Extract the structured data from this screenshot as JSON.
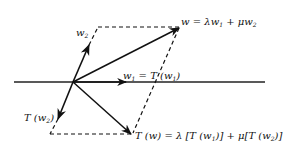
{
  "diagram": {
    "type": "vector-parallelogram",
    "colors": {
      "stroke": "#111111",
      "background": "#ffffff"
    },
    "labels": {
      "w2": {
        "main": "w",
        "sub": "2"
      },
      "w": {
        "text": "w = λw",
        "sub1": "1",
        "mid": " + μw",
        "sub2": "2"
      },
      "w1": {
        "text": "w",
        "sub1": "1",
        "mid": " = T (w",
        "sub2": "1",
        "end": ")"
      },
      "Tw2": {
        "text": "T (w",
        "sub": "2",
        "end": ")"
      },
      "Tw": {
        "text": "T (w) = λ [T (w",
        "sub1": "1",
        "mid": ")] + μ[T (w",
        "sub2": "2",
        "end": ")]"
      }
    },
    "vectors": [
      {
        "name": "w1",
        "from": [
          73,
          82
        ],
        "to": [
          126,
          82
        ]
      },
      {
        "name": "w2",
        "from": [
          73,
          82
        ],
        "to": [
          89,
          45
        ]
      },
      {
        "name": "w",
        "from": [
          73,
          82
        ],
        "to": [
          179,
          28
        ]
      },
      {
        "name": "T(w2)",
        "from": [
          73,
          82
        ],
        "to": [
          58,
          119
        ]
      },
      {
        "name": "T(w)",
        "from": [
          73,
          82
        ],
        "to": [
          131,
          134
        ]
      }
    ],
    "axis": {
      "from": [
        14,
        82
      ],
      "to": [
        265,
        82
      ]
    }
  }
}
